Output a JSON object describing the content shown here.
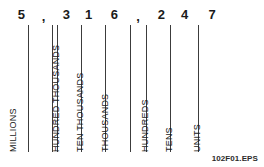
{
  "figure": {
    "file_id": "102F01.EPS",
    "number_shown": "5,316,247",
    "line_color": "#3c3c3c",
    "text_color": "#1a1a1a",
    "background_color": "#ffffff"
  },
  "digits": [
    {
      "char": "5",
      "type": "digit",
      "x": 43
    },
    {
      "char": ",",
      "type": "comma",
      "x": 110
    },
    {
      "char": "3",
      "type": "digit",
      "x": 178
    },
    {
      "char": "1",
      "type": "digit",
      "x": 245
    },
    {
      "char": "6",
      "type": "digit",
      "x": 322
    },
    {
      "char": ",",
      "type": "comma",
      "x": 393
    },
    {
      "char": "2",
      "type": "digit",
      "x": 463
    },
    {
      "char": "4",
      "type": "digit",
      "x": 533
    },
    {
      "char": "7",
      "type": "digit",
      "x": 615
    }
  ],
  "rules": [
    {
      "x": 28
    },
    {
      "x": 52
    },
    {
      "x": 57
    },
    {
      "x": 81
    },
    {
      "x": 105
    },
    {
      "x": 130
    },
    {
      "x": 146
    },
    {
      "x": 170
    },
    {
      "x": 198
    }
  ],
  "place_labels": [
    {
      "text": "MILLIONS",
      "x": 18
    },
    {
      "text": "HUNDRED THOUSANDS",
      "x": 61
    },
    {
      "text": "TEN THOUSANDS",
      "x": 85
    },
    {
      "text": "THOUSANDS",
      "x": 110
    },
    {
      "text": "HUNDREDS",
      "x": 150
    },
    {
      "text": "TENS",
      "x": 174
    },
    {
      "text": "UNITS",
      "x": 202
    }
  ]
}
